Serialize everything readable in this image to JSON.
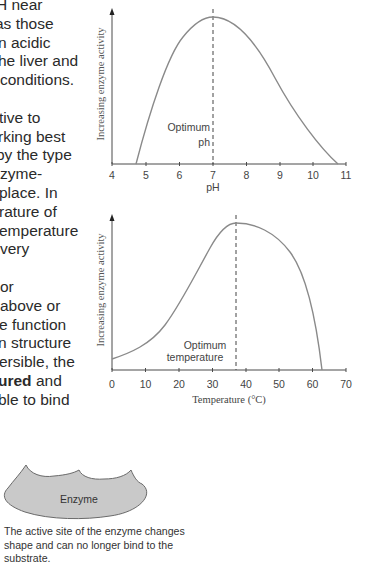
{
  "body_text": {
    "lines": [
      {
        "text": "H near",
        "offset": -4
      },
      {
        "text": "as those",
        "offset": -5
      },
      {
        "text": "n acidic",
        "offset": -2
      },
      {
        "text": "he liver and",
        "offset": -2
      },
      {
        "text": "conditions.",
        "offset": 0
      },
      {
        "text": "",
        "offset": 0
      },
      {
        "text": "tive to",
        "offset": -1
      },
      {
        "text": "rking best",
        "offset": -2
      },
      {
        "text": "by the type",
        "offset": -4
      },
      {
        "text": "zyme-",
        "offset": 0
      },
      {
        "text": "place. In",
        "offset": -1
      },
      {
        "text": "rature of",
        "offset": -1
      },
      {
        "text": "emperature",
        "offset": -1
      },
      {
        "text": "very",
        "offset": 0
      },
      {
        "text": "",
        "offset": 0
      },
      {
        "text": "or",
        "offset": 0
      },
      {
        "text": " above or",
        "offset": 0
      },
      {
        "text": "e function",
        "offset": -1
      },
      {
        "text": "n structure",
        "offset": -2
      },
      {
        "text": "ersible, the",
        "offset": -1
      },
      {
        "text": "ured",
        "bold": true,
        "after": " and",
        "offset": -2
      },
      {
        "text": "ble to bind",
        "offset": -2
      }
    ]
  },
  "chart_data": [
    {
      "type": "line",
      "title": "",
      "xlabel": "pH",
      "ylabel": "Increasing enzyme activity",
      "xlim": [
        4,
        11
      ],
      "x_ticks": [
        4,
        5,
        6,
        7,
        8,
        9,
        10,
        11
      ],
      "grid": false,
      "annotation": {
        "text_lines": [
          "Optimum",
          "ph"
        ],
        "x": 7,
        "style": "dashed vertical line"
      },
      "x": [
        4.7,
        5.0,
        5.5,
        6.0,
        6.5,
        7.0,
        7.5,
        8.0,
        8.5,
        9.0,
        9.5,
        10.0,
        10.6
      ],
      "values": [
        0,
        0.26,
        0.6,
        0.83,
        0.96,
        1.0,
        0.96,
        0.84,
        0.66,
        0.45,
        0.26,
        0.11,
        0
      ]
    },
    {
      "type": "line",
      "title": "",
      "xlabel": "Temperature (°C)",
      "ylabel": "Increasing enzyme activity",
      "xlim": [
        0,
        70
      ],
      "x_ticks": [
        0,
        10,
        20,
        30,
        40,
        50,
        60,
        70
      ],
      "grid": false,
      "annotation": {
        "text_lines": [
          "Optimum",
          "temperature"
        ],
        "x": 37,
        "style": "dashed vertical line"
      },
      "x": [
        0,
        5,
        10,
        15,
        20,
        25,
        30,
        35,
        37,
        40,
        45,
        50,
        55,
        60,
        63
      ],
      "values": [
        0.08,
        0.14,
        0.22,
        0.34,
        0.5,
        0.68,
        0.86,
        0.98,
        1.0,
        0.99,
        0.94,
        0.84,
        0.65,
        0.32,
        0
      ]
    }
  ],
  "ph_chart": {
    "ylabel": "Increasing enzyme activity",
    "xlabel": "pH",
    "ticks": [
      "4",
      "5",
      "6",
      "7",
      "8",
      "9",
      "10",
      "11"
    ],
    "annotation_line1": "Optimum",
    "annotation_line2": "ph"
  },
  "temp_chart": {
    "ylabel": "Increasing enzyme activity",
    "xlabel": "Temperature (°C)",
    "ticks": [
      "0",
      "10",
      "20",
      "30",
      "40",
      "50",
      "60",
      "70"
    ],
    "annotation_line1": "Optimum",
    "annotation_line2": "temperature"
  },
  "enzyme_figure": {
    "label": "Enzyme",
    "fill_color": "#c9c9c9",
    "caption_lines": [
      "The active site of the enzyme changes",
      "shape and can no longer bind to the",
      "substrate."
    ]
  },
  "colors": {
    "curve": "#8a8a8a",
    "axis": "#4a4a4a",
    "text": "#2a2a2a"
  }
}
